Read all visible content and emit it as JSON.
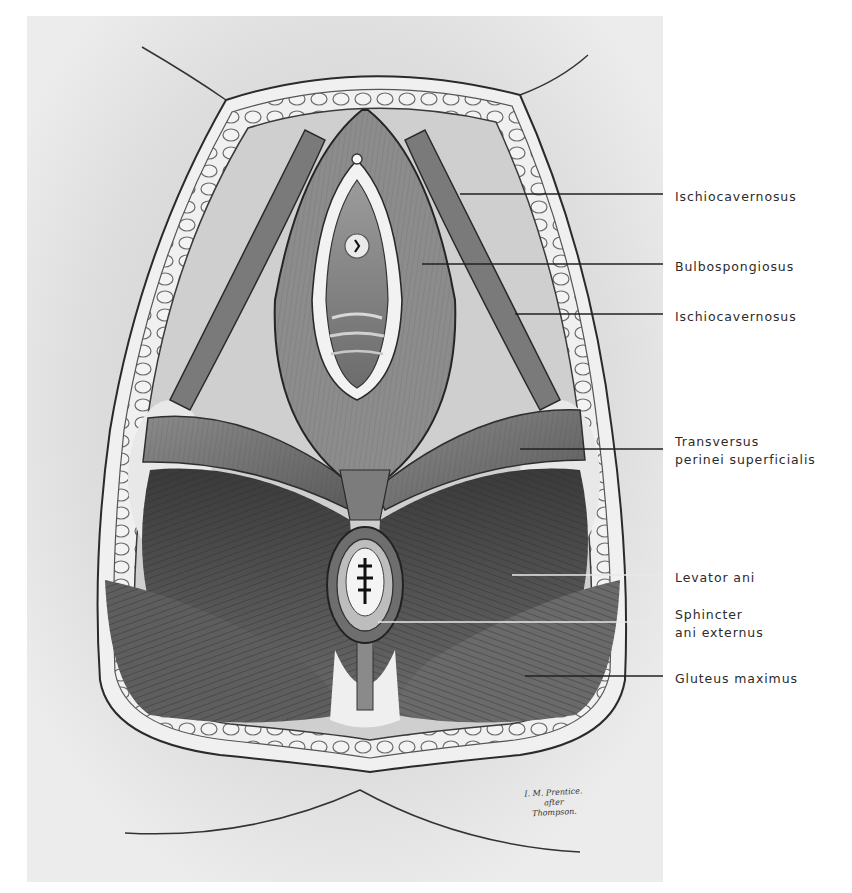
{
  "figure": {
    "panel_background": "#e6e6e6",
    "ink_color": "#1e1e1e",
    "leader_color": "#222222"
  },
  "labels": [
    {
      "id": "ischiocavernosus-upper",
      "lines": [
        "Ischiocavernosus"
      ],
      "leader_y": 194,
      "leader_x_start": 460,
      "text_top": 188
    },
    {
      "id": "bulbospongiosus",
      "lines": [
        "Bulbospongiosus"
      ],
      "leader_y": 264,
      "leader_x_start": 422,
      "text_top": 258
    },
    {
      "id": "ischiocavernosus-lower",
      "lines": [
        "Ischiocavernosus"
      ],
      "leader_y": 314,
      "leader_x_start": 515,
      "text_top": 308
    },
    {
      "id": "transversus-perinei-superficialis",
      "lines": [
        "Transversus",
        "perinei superficialis"
      ],
      "leader_y": 449,
      "leader_x_start": 520,
      "text_top": 433
    },
    {
      "id": "levator-ani",
      "lines": [
        "Levator ani"
      ],
      "leader_y": 575,
      "leader_x_start": 512,
      "text_top": 569
    },
    {
      "id": "sphincter-ani-externus",
      "lines": [
        "Sphincter",
        "ani externus"
      ],
      "leader_y": 622,
      "leader_x_start": 378,
      "text_top": 606
    },
    {
      "id": "gluteus-maximus",
      "lines": [
        "Gluteus maximus"
      ],
      "leader_y": 676,
      "leader_x_start": 525,
      "text_top": 670
    }
  ],
  "signature": {
    "lines": [
      "I. M. Prentice.",
      "after",
      "Thompson."
    ]
  }
}
